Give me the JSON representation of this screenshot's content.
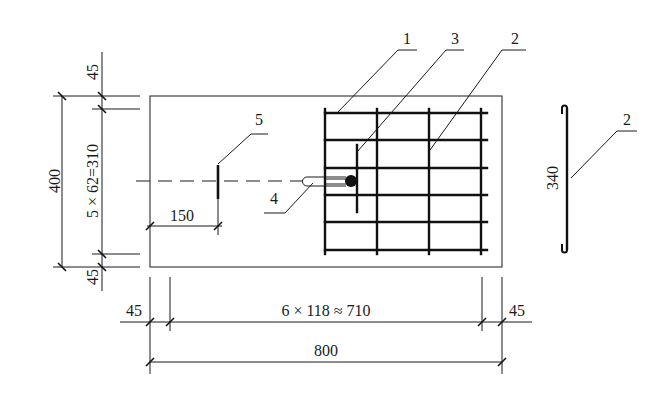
{
  "drawing": {
    "title": "Slab reinforcement plan with embedded anchor",
    "colors": {
      "line": "#1a1a1a",
      "background": "#ffffff"
    },
    "dimensions": {
      "left_total": "400",
      "left_top_cover": "45",
      "left_spacing": "5 × 62=310",
      "left_bottom_cover": "45",
      "anchor_offset": "150",
      "bottom_left_cover": "45",
      "bottom_spacing": "6 × 118 ≈ 710",
      "bottom_right_cover": "45",
      "bottom_total": "800",
      "bar_length": "340"
    },
    "callouts": [
      {
        "id": "1",
        "label": "1"
      },
      {
        "id": "2",
        "label": "2"
      },
      {
        "id": "3",
        "label": "3"
      },
      {
        "id": "4",
        "label": "4"
      },
      {
        "id": "5",
        "label": "5"
      }
    ],
    "detail": {
      "label": "2",
      "length": "340"
    }
  }
}
